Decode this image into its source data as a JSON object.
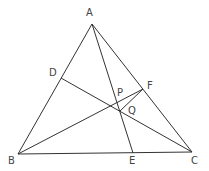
{
  "figure": {
    "line_color": "#333333",
    "label_color": "#444444",
    "points": {
      "A": {
        "label": "A",
        "x": 92,
        "y": 24
      },
      "B": {
        "label": "B",
        "x": 18,
        "y": 154
      },
      "C": {
        "label": "C",
        "x": 192,
        "y": 152
      },
      "D": {
        "label": "D",
        "x": 61,
        "y": 78
      },
      "E": {
        "label": "E",
        "x": 133,
        "y": 153
      },
      "F": {
        "label": "F",
        "x": 143,
        "y": 89
      },
      "P": {
        "label": "P",
        "x": 117,
        "y": 101
      },
      "Q": {
        "label": "Q",
        "x": 120,
        "y": 111
      }
    },
    "segments": [
      "AB",
      "BC",
      "CA",
      "AE",
      "DC",
      "BF",
      "FQ"
    ]
  }
}
